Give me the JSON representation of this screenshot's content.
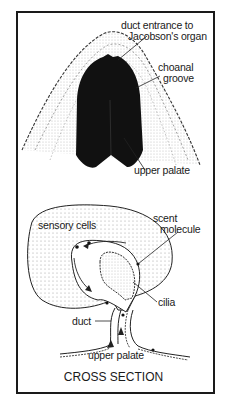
{
  "top_panel": {
    "labels": {
      "duct_entrance_line1": "duct entrance to",
      "duct_entrance_line2": "Jacobson's organ",
      "choanal_line1": "choanal",
      "choanal_line2": "groove",
      "upper_palate": "upper palate"
    }
  },
  "bottom_panel": {
    "labels": {
      "sensory_cells": "sensory cells",
      "scent_line1": "scent",
      "scent_line2": "molecule",
      "cilia": "cilia",
      "duct": "duct",
      "upper_palate": "upper palate"
    },
    "caption": "CROSS SECTION"
  },
  "colors": {
    "ink": "#1a1a1a",
    "fill_dark": "#111111",
    "stipple": "#8a8a8a",
    "background": "#ffffff"
  }
}
